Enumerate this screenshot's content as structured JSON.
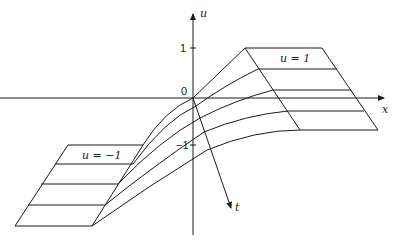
{
  "diagram": {
    "axes": {
      "u_label": "u",
      "x_label": "x",
      "t_label": "t",
      "ticks": {
        "one": "1",
        "zero": "0",
        "minus_one": "−1"
      }
    },
    "plateaus": {
      "upper_label": "u = 1",
      "lower_label": "u = −1"
    },
    "colors": {
      "ink": "#1a1a1a",
      "background": "#ffffff"
    }
  }
}
